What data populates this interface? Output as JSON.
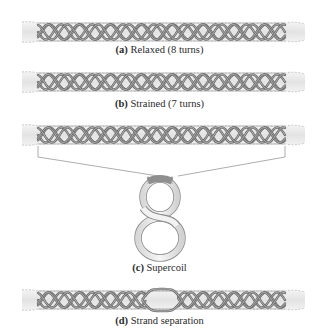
{
  "figure": {
    "panels": [
      {
        "id": "a",
        "letter": "(a)",
        "label": "Relaxed (8 turns)",
        "turns": 8,
        "state": "relaxed"
      },
      {
        "id": "b",
        "letter": "(b)",
        "label": "Strained (7 turns)",
        "turns": 7,
        "state": "strained"
      },
      {
        "id": "c",
        "letter": "(c)",
        "label": "Supercoil",
        "turns": 7,
        "state": "supercoil"
      },
      {
        "id": "d",
        "letter": "(d)",
        "label": "Strand separation",
        "turns": 7,
        "state": "strand-separation"
      }
    ],
    "colors": {
      "strand": "#6f6f6f",
      "strand_light": "#bdbdbd",
      "tube": "#e9e9e9",
      "tube_edge": "#a8a8a8",
      "bracket": "#8a8a8a",
      "highlight": "#8f8f8f"
    }
  }
}
